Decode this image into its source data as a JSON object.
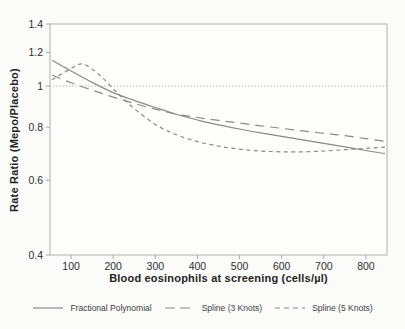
{
  "figure": {
    "background": "#fbfbfa",
    "plot_fill": "#fdfdfc",
    "frame_color": "#b0b0b0",
    "tick_color": "#a8a8a8",
    "tick_text_color": "#2e2e2e",
    "title_text_color": "#1f1f1f",
    "curve_color": "#8a8a8a",
    "reference_line_color": "#9c9c9c"
  },
  "chart_data": {
    "type": "line",
    "title": "",
    "xlabel": "Blood eosinophils at screening (cells/µl)",
    "ylabel": "Rate Ratio (Mepo/Placebo)",
    "xlim": [
      50,
      850
    ],
    "ylim": [
      0.4,
      1.4
    ],
    "y_scale": "log",
    "grid": false,
    "reference_line_y": 1.0,
    "x_ticks": [
      100,
      200,
      300,
      400,
      500,
      600,
      700,
      800
    ],
    "x_tick_labels": [
      "100",
      "200",
      "300",
      "400",
      "500",
      "600",
      "700",
      "800"
    ],
    "y_ticks": [
      0.4,
      0.6,
      0.8,
      1.0,
      1.2,
      1.4
    ],
    "y_tick_labels": [
      "0.4",
      "0.6",
      "0.8",
      "1",
      "1.2",
      "1.4"
    ],
    "legend_position": "bottom",
    "series": [
      {
        "name": "Fractional Polynomial",
        "dash": "solid",
        "x": [
          55,
          100,
          150,
          200,
          250,
          300,
          350,
          400,
          450,
          500,
          550,
          600,
          650,
          700,
          750,
          800,
          845
        ],
        "y": [
          1.15,
          1.085,
          1.02,
          0.965,
          0.925,
          0.89,
          0.858,
          0.832,
          0.81,
          0.792,
          0.776,
          0.761,
          0.747,
          0.733,
          0.719,
          0.705,
          0.693
        ]
      },
      {
        "name": "Spline (3 Knots)",
        "dash": "long-dash",
        "x": [
          55,
          100,
          150,
          200,
          250,
          300,
          350,
          400,
          450,
          500,
          550,
          600,
          650,
          700,
          750,
          800,
          845
        ],
        "y": [
          1.06,
          1.018,
          0.978,
          0.942,
          0.91,
          0.882,
          0.858,
          0.843,
          0.83,
          0.818,
          0.806,
          0.795,
          0.784,
          0.774,
          0.764,
          0.752,
          0.741
        ]
      },
      {
        "name": "Spline (5 Knots)",
        "dash": "short-dash",
        "x": [
          55,
          100,
          125,
          150,
          175,
          200,
          225,
          250,
          300,
          350,
          400,
          450,
          500,
          550,
          600,
          650,
          700,
          750,
          800,
          845
        ],
        "y": [
          1.035,
          1.1,
          1.128,
          1.096,
          1.045,
          0.985,
          0.932,
          0.885,
          0.812,
          0.768,
          0.74,
          0.722,
          0.71,
          0.703,
          0.7,
          0.7,
          0.703,
          0.708,
          0.713,
          0.718
        ]
      }
    ]
  }
}
